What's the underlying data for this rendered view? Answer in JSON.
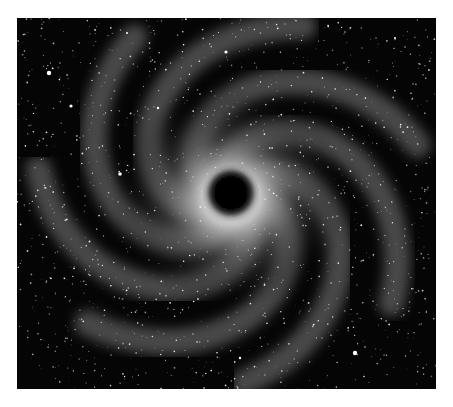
{
  "image": {
    "subject": "spiral galaxy with black hole",
    "background_color": "#ffffff",
    "frame": {
      "x": 17,
      "y": 18,
      "width": 419,
      "height": 371,
      "color": "#050505"
    },
    "core": {
      "cx": 214,
      "cy": 175,
      "r": 23,
      "color": "#000000"
    },
    "glow_color": "#d8d8d8",
    "bright_stars": [
      {
        "x": 32,
        "y": 55,
        "r": 2.2
      },
      {
        "x": 54,
        "y": 88,
        "r": 1.6
      },
      {
        "x": 103,
        "y": 156,
        "r": 1.8
      },
      {
        "x": 209,
        "y": 34,
        "r": 1.6
      },
      {
        "x": 338,
        "y": 335,
        "r": 2.2
      },
      {
        "x": 141,
        "y": 90,
        "r": 1.2
      },
      {
        "x": 110,
        "y": 15,
        "r": 1.0
      },
      {
        "x": 378,
        "y": 20,
        "r": 1.0
      },
      {
        "x": 223,
        "y": 340,
        "r": 1.2
      }
    ]
  }
}
